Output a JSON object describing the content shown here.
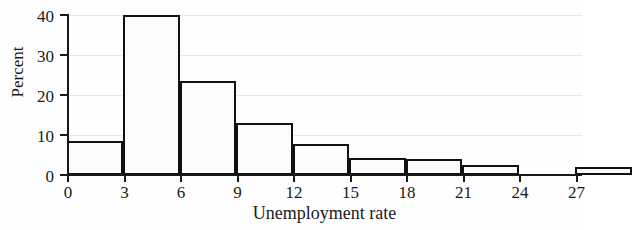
{
  "chart_data": {
    "type": "bar",
    "title": "",
    "xlabel": "Unemployment rate",
    "ylabel": "Percent",
    "xlim": [
      0,
      30
    ],
    "ylim": [
      0,
      40
    ],
    "grid": true,
    "legend": null,
    "bin_width": 3,
    "bin_edges": [
      0,
      3,
      6,
      9,
      12,
      15,
      18,
      21,
      24,
      27,
      30
    ],
    "categories": [
      "0-3",
      "3-6",
      "6-9",
      "9-12",
      "12-15",
      "15-18",
      "18-21",
      "21-24",
      "24-27",
      "27-30"
    ],
    "values": [
      8.5,
      40,
      23.5,
      13,
      7.75,
      4.25,
      4,
      2.5,
      0,
      2
    ],
    "x_tick_labels": [
      "0",
      "3",
      "6",
      "9",
      "12",
      "15",
      "18",
      "21",
      "24",
      "27"
    ],
    "x_tick_values": [
      0,
      3,
      6,
      9,
      12,
      15,
      18,
      21,
      24,
      27
    ],
    "y_tick_labels": [
      "0",
      "10",
      "20",
      "30",
      "40"
    ],
    "y_tick_values": [
      0,
      10,
      20,
      30,
      40
    ],
    "bar_fill_color": "#fcfcfc",
    "bar_edge_color": "#111111",
    "grid_color": "#e8e8e8",
    "axis_color": "#1a1a1a"
  }
}
